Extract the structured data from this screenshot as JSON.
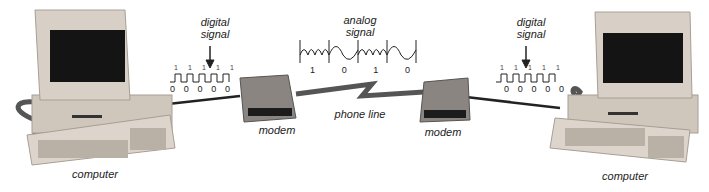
{
  "diagram": {
    "left_computer": {
      "label": "computer"
    },
    "right_computer": {
      "label": "computer"
    },
    "left_modem": {
      "label": "modem"
    },
    "right_modem": {
      "label": "modem"
    },
    "phone_line": {
      "label": "phone line"
    },
    "left_digital_signal": {
      "label_line1": "digital",
      "label_line2": "signal",
      "high_marks": [
        "1",
        "1",
        "1",
        "1",
        "1"
      ],
      "bits": [
        "0",
        "0",
        "0",
        "0",
        "0"
      ]
    },
    "right_digital_signal": {
      "label_line1": "digital",
      "label_line2": "signal",
      "high_marks": [
        "1",
        "1",
        "1",
        "1",
        "1"
      ],
      "bits": [
        "0",
        "0",
        "0",
        "0",
        "0"
      ]
    },
    "analog_signal": {
      "label_line1": "analog",
      "label_line2": "signal",
      "bits": [
        "1",
        "0",
        "1",
        "0"
      ]
    },
    "colors": {
      "case": "#cfc6bc",
      "case_shadow": "#a89e94",
      "screen": "#141414",
      "cable": "#222222",
      "modem": "#8a8580",
      "text": "#222222"
    }
  }
}
